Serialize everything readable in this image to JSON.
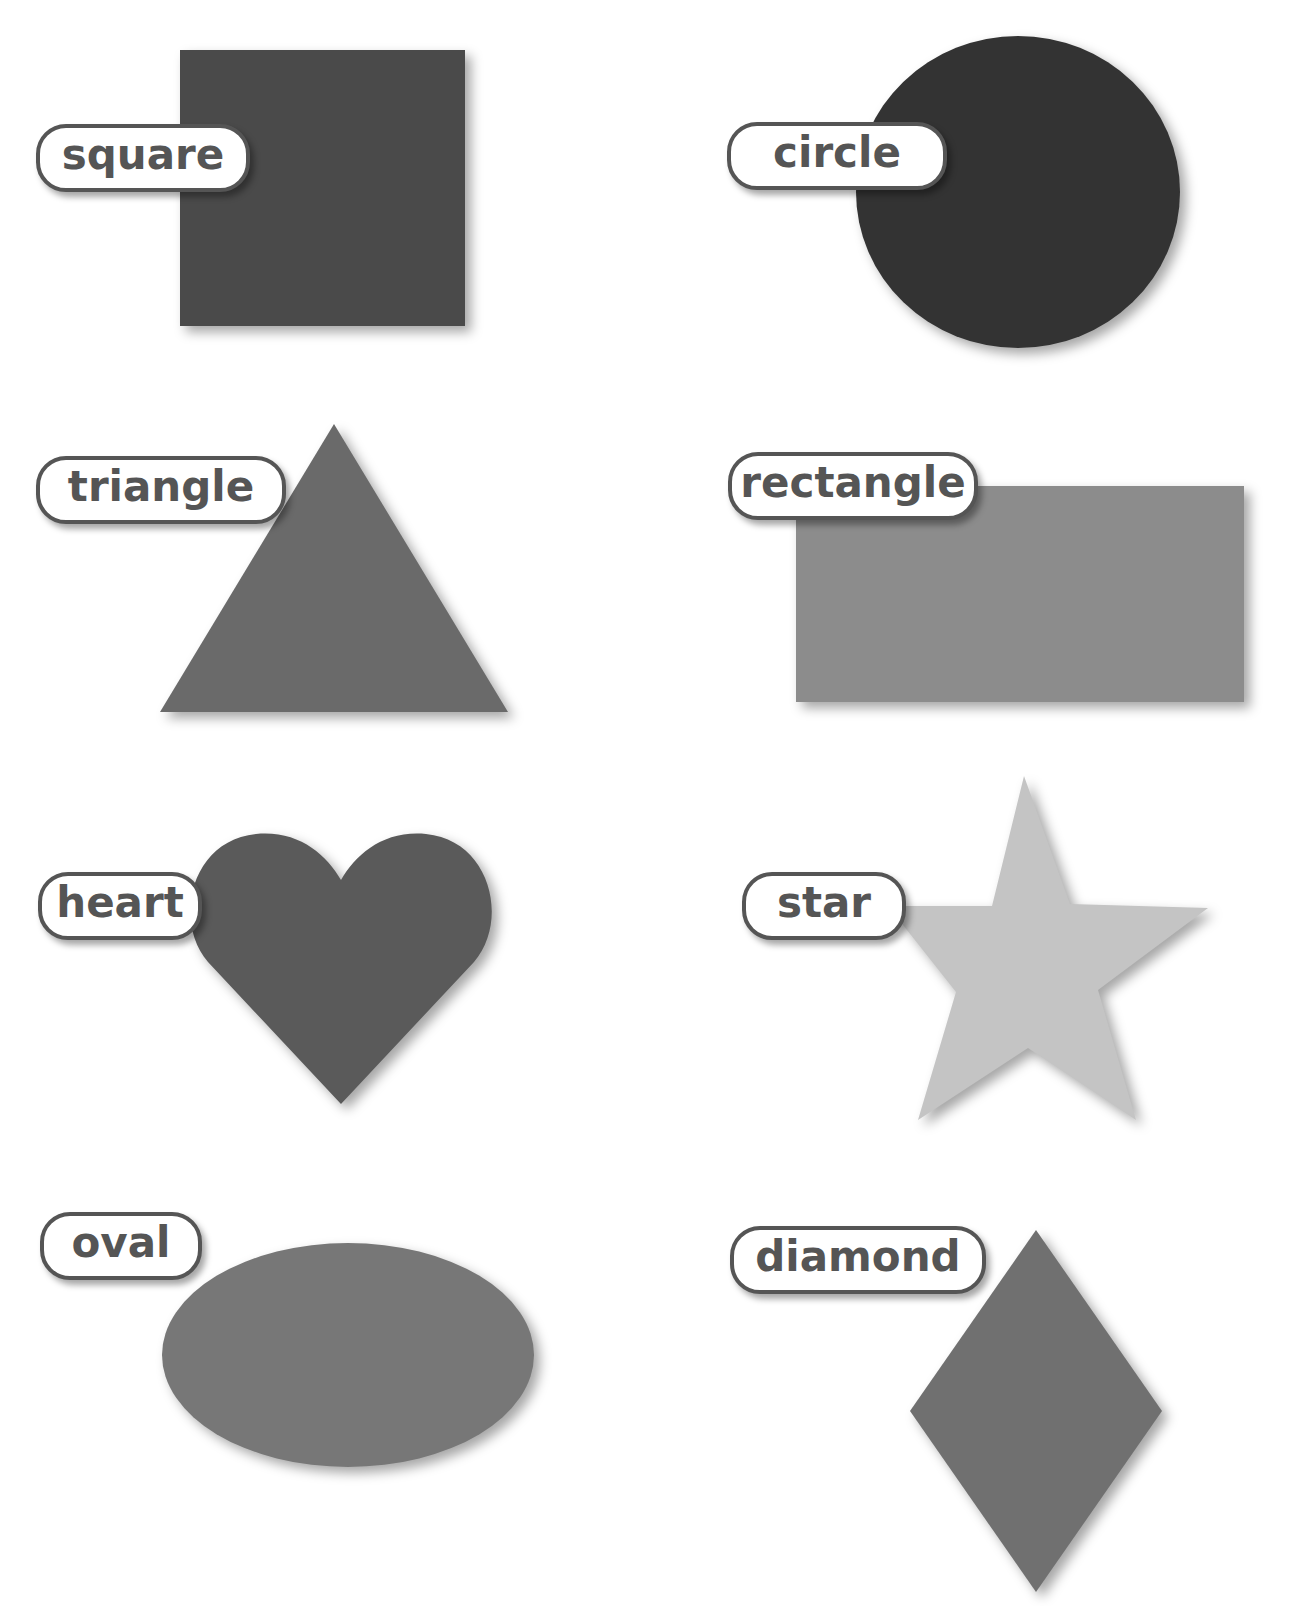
{
  "shapes": [
    {
      "id": "square",
      "label": "square",
      "color": "#4a4a4a"
    },
    {
      "id": "circle",
      "label": "circle",
      "color": "#333333"
    },
    {
      "id": "triangle",
      "label": "triangle",
      "color": "#6a6a6a"
    },
    {
      "id": "rectangle",
      "label": "rectangle",
      "color": "#8c8c8c"
    },
    {
      "id": "heart",
      "label": "heart",
      "color": "#5a5a5a"
    },
    {
      "id": "star",
      "label": "star",
      "color": "#c4c4c4"
    },
    {
      "id": "oval",
      "label": "oval",
      "color": "#777777"
    },
    {
      "id": "diamond",
      "label": "diamond",
      "color": "#707070"
    }
  ]
}
